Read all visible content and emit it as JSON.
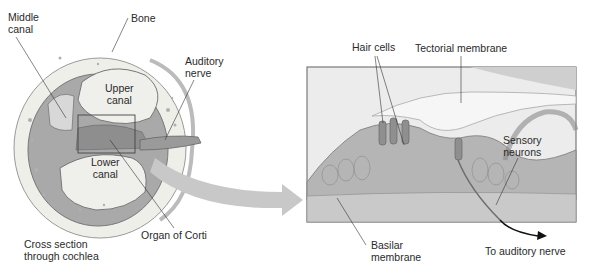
{
  "figure": {
    "left_panel": {
      "title": "Cross section through cochlea",
      "title_lines": [
        "Cross section",
        "through cochlea"
      ],
      "labels": {
        "middle_canal": [
          "Middle",
          "canal"
        ],
        "bone": "Bone",
        "auditory_nerve": [
          "Auditory",
          "nerve"
        ],
        "upper_canal": [
          "Upper",
          "canal"
        ],
        "lower_canal": [
          "Lower",
          "canal"
        ],
        "organ_of_corti": "Organ of Corti"
      }
    },
    "right_panel": {
      "labels": {
        "hair_cells": "Hair cells",
        "tectorial_membrane": "Tectorial membrane",
        "sensory_neurons": [
          "Sensory",
          "neurons"
        ],
        "basilar_membrane": [
          "Basilar",
          "membrane"
        ],
        "to_auditory_nerve": "To auditory nerve"
      }
    },
    "colors": {
      "background": "#ffffff",
      "tissue_light": "#e6e6e6",
      "tissue_mid": "#b8b8b8",
      "tissue_dark": "#7a7a7a",
      "bone": "#efefea",
      "arrow": "#c8c8c8",
      "leader_line": "#333333",
      "text": "#2a2a2a"
    }
  }
}
